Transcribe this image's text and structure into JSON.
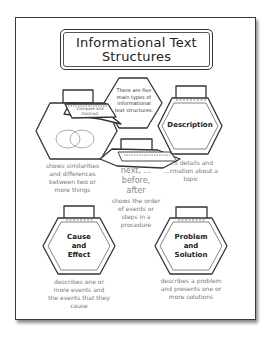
{
  "poster": {
    "title_line1": "Informational Text",
    "title_line2": "Structures",
    "intro": "There are five main types of informational text structures."
  },
  "structures": [
    {
      "name": "Compare and Contrast",
      "flap_text": "Compare and Contrast",
      "description": "shows similarities and differences between two or more things",
      "icon": "venn-diagram-icon"
    },
    {
      "name": "Description",
      "flap_text": "",
      "description": "gives details and information about a topic",
      "visible_description": "...s details and ...rmation about a topic"
    },
    {
      "name": "Sequence",
      "flap_text": "Sequence",
      "keywords": [
        "next, ...",
        "before,",
        "after"
      ],
      "description": "shows the order of events or steps in a procedure"
    },
    {
      "name": "Cause and Effect",
      "label_lines": [
        "Cause",
        "and",
        "Effect"
      ],
      "description": "describes one or more events and the events that they cause"
    },
    {
      "name": "Problem and Solution",
      "label_lines": [
        "Problem",
        "and",
        "Solution"
      ],
      "description": "describes a problem and presents one or more solutions"
    }
  ],
  "colors": {
    "stroke": "#333333",
    "desc_text": "#777777",
    "background": "#ffffff"
  }
}
